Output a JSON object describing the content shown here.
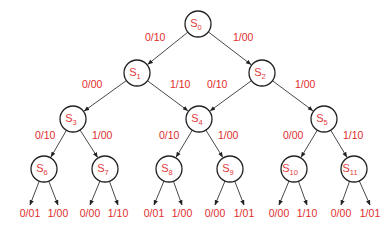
{
  "diagram": {
    "type": "state-tree",
    "colors": {
      "text": "#e02c2c",
      "stroke": "#222222",
      "background": "#ffffff"
    },
    "nodes": [
      {
        "id": "S0",
        "label": "S",
        "sub": "0",
        "x": 198,
        "y": 24
      },
      {
        "id": "S1",
        "label": "S",
        "sub": "1",
        "x": 137,
        "y": 73
      },
      {
        "id": "S2",
        "label": "S",
        "sub": "2",
        "x": 262,
        "y": 73
      },
      {
        "id": "S3",
        "label": "S",
        "sub": "3",
        "x": 73,
        "y": 119
      },
      {
        "id": "S4",
        "label": "S",
        "sub": "4",
        "x": 199,
        "y": 119
      },
      {
        "id": "S5",
        "label": "S",
        "sub": "5",
        "x": 324,
        "y": 119
      },
      {
        "id": "S6",
        "label": "S",
        "sub": "6",
        "x": 44,
        "y": 169
      },
      {
        "id": "S7",
        "label": "S",
        "sub": "7",
        "x": 105,
        "y": 169
      },
      {
        "id": "S8",
        "label": "S",
        "sub": "8",
        "x": 169,
        "y": 169
      },
      {
        "id": "S9",
        "label": "S",
        "sub": "9",
        "x": 230,
        "y": 169
      },
      {
        "id": "S10",
        "label": "S",
        "sub": "10",
        "x": 294,
        "y": 169
      },
      {
        "id": "S11",
        "label": "S",
        "sub": "11",
        "x": 354,
        "y": 169
      }
    ],
    "edges": [
      {
        "from": "S0",
        "to": "S1",
        "label": "0/10",
        "lx": 145,
        "ly": 41,
        "anchor": "start"
      },
      {
        "from": "S0",
        "to": "S2",
        "label": "1/00",
        "lx": 233,
        "ly": 41,
        "anchor": "start"
      },
      {
        "from": "S1",
        "to": "S3",
        "label": "0/00",
        "lx": 82,
        "ly": 88,
        "anchor": "start"
      },
      {
        "from": "S1",
        "to": "S4",
        "label": "1/10",
        "lx": 170,
        "ly": 88,
        "anchor": "start"
      },
      {
        "from": "S2",
        "to": "S4",
        "label": "0/10",
        "lx": 207,
        "ly": 88,
        "anchor": "start"
      },
      {
        "from": "S2",
        "to": "S5",
        "label": "1/00",
        "lx": 295,
        "ly": 88,
        "anchor": "start"
      },
      {
        "from": "S3",
        "to": "S6",
        "label": "0/10",
        "lx": 35,
        "ly": 139,
        "anchor": "start"
      },
      {
        "from": "S3",
        "to": "S7",
        "label": "1/00",
        "lx": 92,
        "ly": 139,
        "anchor": "start"
      },
      {
        "from": "S4",
        "to": "S8",
        "label": "0/10",
        "lx": 159,
        "ly": 139,
        "anchor": "start"
      },
      {
        "from": "S4",
        "to": "S9",
        "label": "1/00",
        "lx": 218,
        "ly": 139,
        "anchor": "start"
      },
      {
        "from": "S5",
        "to": "S10",
        "label": "0/00",
        "lx": 283,
        "ly": 139,
        "anchor": "start"
      },
      {
        "from": "S5",
        "to": "S11",
        "label": "1/10",
        "lx": 343,
        "ly": 139,
        "anchor": "start"
      }
    ],
    "outputs": [
      {
        "from": "S6",
        "label": "0/01",
        "x": 30
      },
      {
        "from": "S6",
        "label": "1/00",
        "x": 58
      },
      {
        "from": "S7",
        "label": "0/00",
        "x": 90
      },
      {
        "from": "S7",
        "label": "1/10",
        "x": 118
      },
      {
        "from": "S8",
        "label": "0/01",
        "x": 154
      },
      {
        "from": "S8",
        "label": "1/00",
        "x": 182
      },
      {
        "from": "S9",
        "label": "0/00",
        "x": 215
      },
      {
        "from": "S9",
        "label": "1/01",
        "x": 244
      },
      {
        "from": "S10",
        "label": "0/00",
        "x": 279
      },
      {
        "from": "S10",
        "label": "1/10",
        "x": 307
      },
      {
        "from": "S11",
        "label": "0/00",
        "x": 341
      },
      {
        "from": "S11",
        "label": "1/01",
        "x": 370
      }
    ],
    "radius": 13,
    "output_arrow_tip_y": 205,
    "output_label_y": 217
  }
}
